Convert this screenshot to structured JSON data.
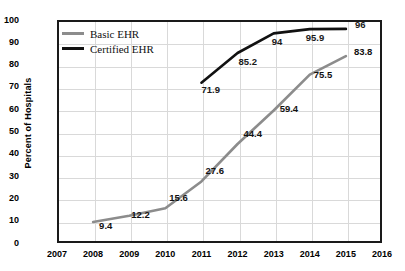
{
  "chart_data": {
    "type": "line",
    "title": "",
    "xlabel": "",
    "ylabel": "Percent of Hospitals",
    "x": [
      2007,
      2008,
      2009,
      2010,
      2011,
      2012,
      2013,
      2014,
      2015,
      2016
    ],
    "xlim": [
      2007,
      2016
    ],
    "ylim": [
      0,
      100
    ],
    "yticks": [
      0,
      10,
      20,
      30,
      40,
      50,
      60,
      70,
      80,
      90,
      100
    ],
    "xticks": [
      "2007",
      "2008",
      "2009",
      "2010",
      "2011",
      "2012",
      "2013",
      "2014",
      "2015",
      "2016"
    ],
    "grid": true,
    "legend_position": "top-left",
    "series": [
      {
        "name": "Basic EHR",
        "color": "#8c8c8c",
        "x": [
          2008,
          2009,
          2010,
          2011,
          2012,
          2013,
          2014,
          2015
        ],
        "values": [
          9.4,
          12.2,
          15.6,
          27.6,
          44.4,
          59.4,
          75.5,
          83.8
        ],
        "labels": [
          "9.4",
          "12.2",
          "15.6",
          "27.6",
          "44.4",
          "59.4",
          "75.5",
          "83.8"
        ]
      },
      {
        "name": "Certified EHR",
        "color": "#111111",
        "x": [
          2011,
          2012,
          2013,
          2014,
          2015
        ],
        "values": [
          71.9,
          85.2,
          94,
          95.9,
          96
        ],
        "labels": [
          "71.9",
          "85.2",
          "94",
          "95.9",
          "96"
        ]
      }
    ]
  },
  "legend": {
    "items": [
      {
        "label": "Basic EHR"
      },
      {
        "label": "Certified EHR"
      }
    ]
  },
  "axes": {
    "y_title": "Percent of Hospitals"
  }
}
